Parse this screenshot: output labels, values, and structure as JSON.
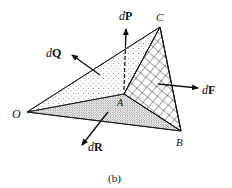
{
  "figure": {
    "caption": "(b)",
    "vertices": {
      "O": {
        "label": "O",
        "x": 27,
        "y": 112
      },
      "A": {
        "label": "A",
        "x": 124,
        "y": 94
      },
      "B": {
        "label": "B",
        "x": 181,
        "y": 131
      },
      "C": {
        "label": "C",
        "x": 160,
        "y": 27
      }
    },
    "faces": [
      {
        "name": "OAC",
        "fill": "light-dots"
      },
      {
        "name": "OAB",
        "fill": "dense-dots"
      },
      {
        "name": "ABC",
        "fill": "crosshatch"
      }
    ],
    "vectors": {
      "dP": {
        "prefix": "d",
        "symbol": "P"
      },
      "dQ": {
        "prefix": "d",
        "symbol": "Q"
      },
      "dR": {
        "prefix": "d",
        "symbol": "R"
      },
      "dF": {
        "prefix": "d",
        "symbol": "F"
      }
    },
    "colors": {
      "ink": "#111111",
      "background": "#ffffff"
    }
  }
}
